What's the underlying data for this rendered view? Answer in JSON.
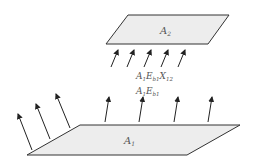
{
  "diagram": {
    "surfaces": [
      {
        "id": "A2",
        "label": "A",
        "sub": "2"
      },
      {
        "id": "A1",
        "label": "A",
        "sub": "1"
      }
    ],
    "flux_labels": {
      "exchange": {
        "a": "A",
        "a_sub": "1",
        "e": "E",
        "e_sub": "b1",
        "x": "X",
        "x_sub": "12"
      },
      "emission": {
        "a": "A",
        "a_sub": "1",
        "e": "E",
        "e_sub": "b1"
      }
    },
    "colors": {
      "surface_fill": "#ededed",
      "stroke": "#333333"
    }
  }
}
